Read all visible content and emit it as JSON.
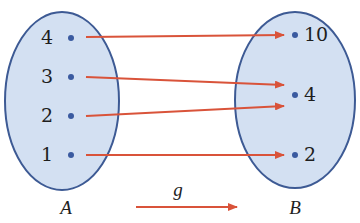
{
  "diagram": {
    "type": "function-mapping",
    "function_label": "g",
    "colors": {
      "set_fill": "#d3e0f2",
      "set_stroke": "#3d5a94",
      "dot": "#3a5aa0",
      "arrow": "#d9533a",
      "text": "#1e1e1e"
    },
    "domain_set": {
      "label": "A",
      "elements": [
        "4",
        "3",
        "2",
        "1"
      ]
    },
    "codomain_set": {
      "label": "B",
      "elements": [
        "10",
        "4",
        "2"
      ]
    },
    "mappings": [
      {
        "from": "4",
        "to": "10"
      },
      {
        "from": "3",
        "to": "4"
      },
      {
        "from": "2",
        "to": "4"
      },
      {
        "from": "1",
        "to": "2"
      }
    ]
  }
}
